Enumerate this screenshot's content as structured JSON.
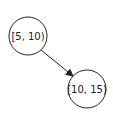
{
  "diagram": {
    "type": "tree",
    "nodes": [
      {
        "id": "n1",
        "label": "[5, 10)",
        "cx": 28,
        "cy": 36,
        "r": 19
      },
      {
        "id": "n2",
        "label": "[10, 15)",
        "cx": 87,
        "cy": 89,
        "r": 19
      }
    ],
    "edges": [
      {
        "from": "n1",
        "to": "n2",
        "x1": 41,
        "y1": 50,
        "x2": 73,
        "y2": 76
      }
    ],
    "colors": {
      "stroke": "#222222",
      "fill": "#ffffff"
    }
  }
}
